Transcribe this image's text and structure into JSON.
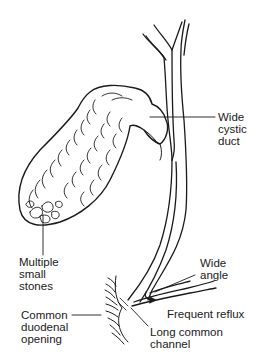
{
  "diagram": {
    "labels": {
      "wide_cystic_duct": [
        "Wide",
        "cystic",
        "duct"
      ],
      "multiple_small_stones": [
        "Multiple",
        "small",
        "stones"
      ],
      "wide_angle": [
        "Wide",
        "angle"
      ],
      "frequent_reflux": [
        "Frequent reflux"
      ],
      "common_duodenal_opening": [
        "Common",
        "duodenal",
        "opening"
      ],
      "long_common_channel": [
        "Long common",
        "channel"
      ]
    },
    "colors": {
      "ink": "#1a1a1a",
      "background": "#ffffff"
    }
  }
}
